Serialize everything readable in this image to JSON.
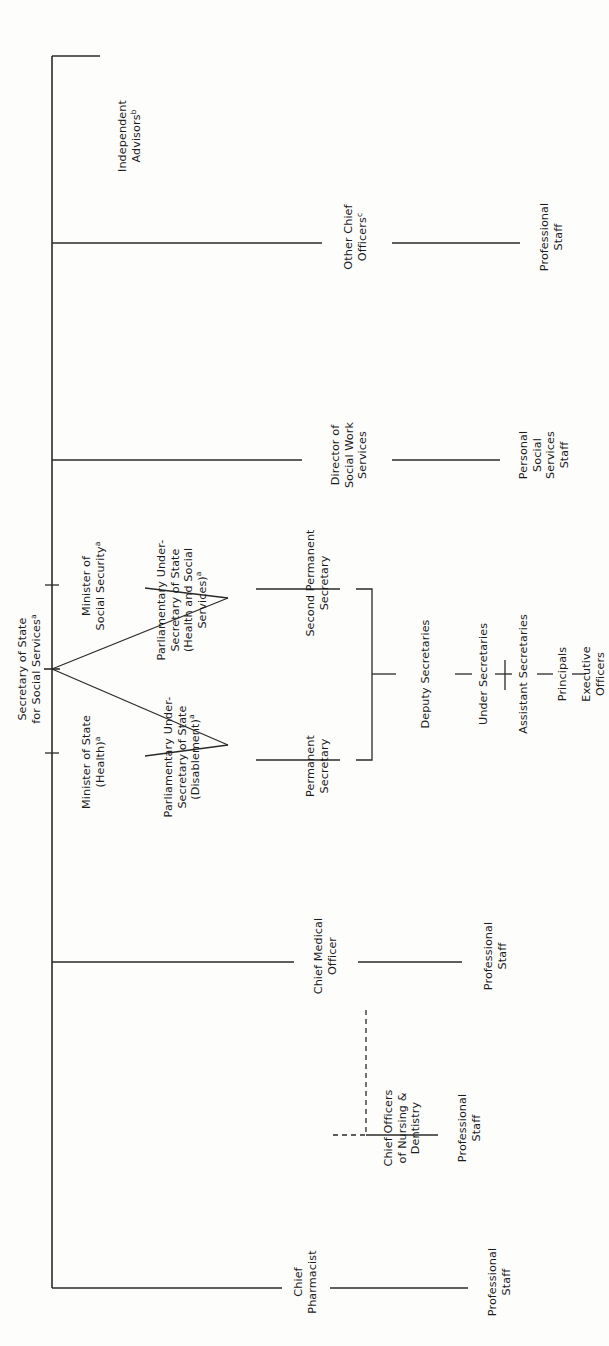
{
  "chart": {
    "orientation": "rotated-90-ccw",
    "root": {
      "id": "secretary-of-state",
      "label": "Secretary of State\nfor Social Services",
      "line1": "Secretary of State",
      "line2": "for Social Services",
      "footnote": "a"
    },
    "nodes": {
      "independent_advisors": {
        "line1": "Independent",
        "line2": "Advisors",
        "footnote": "b"
      },
      "other_chief_officers": {
        "line1": "Other Chief",
        "line2": "Officers",
        "footnote": "c"
      },
      "other_chief_officers_staff": {
        "line1": "Professional",
        "line2": "Staff",
        "footnote": ""
      },
      "director_social_work": {
        "line1": "Director of",
        "line2": "Social Work",
        "line3": "Services",
        "footnote": ""
      },
      "personal_social_services_staff": {
        "line1": "Personal",
        "line2": "Social",
        "line3": "Services",
        "line4": "Staff",
        "footnote": ""
      },
      "minister_social_security": {
        "line1": "Minister of",
        "line2": "Social Security",
        "footnote": "a"
      },
      "minister_health": {
        "line1": "Minister of State",
        "line2": "(Health)",
        "footnote": "a"
      },
      "pus_health_social": {
        "line1": "Parliamentary Under-",
        "line2": "Secretary of State",
        "line3": "(Health and Social",
        "line4": "Services)",
        "footnote": "a"
      },
      "pus_disablement": {
        "line1": "Parliamentary Under-",
        "line2": "Secretary of State",
        "line3": "(Disablement)",
        "footnote": "a"
      },
      "second_permanent_secretary": {
        "line1": "Second Permanent",
        "line2": "Secretary",
        "footnote": ""
      },
      "permanent_secretary": {
        "line1": "Permanent",
        "line2": "Secretary",
        "footnote": ""
      },
      "deputy_secretaries": {
        "line1": "Deputy Secretaries",
        "footnote": ""
      },
      "under_secretaries": {
        "line1": "Under Secretaries",
        "footnote": ""
      },
      "assistant_secretaries": {
        "line1": "Assistant Secretaries",
        "footnote": ""
      },
      "principals": {
        "line1": "Principals",
        "footnote": ""
      },
      "executive_officers": {
        "line1": "Executive",
        "line2": "Officers",
        "footnote": ""
      },
      "chief_medical_officer": {
        "line1": "Chief Medical",
        "line2": "Officer",
        "footnote": ""
      },
      "chief_medical_staff": {
        "line1": "Professional",
        "line2": "Staff",
        "footnote": ""
      },
      "chief_officers_nursing": {
        "line1": "Chief Officers",
        "line2": "of Nursing &",
        "line3": "Dentistry",
        "footnote": ""
      },
      "chief_officers_nursing_staff": {
        "line1": "Professional",
        "line2": "Staff",
        "footnote": ""
      },
      "chief_pharmacist": {
        "line1": "Chief",
        "line2": "Pharmacist",
        "footnote": ""
      },
      "chief_pharmacist_staff": {
        "line1": "Professional",
        "line2": "Staff",
        "footnote": ""
      }
    },
    "footnotes": [
      "a",
      "b",
      "c"
    ],
    "colors": {
      "line": "#2a2a2a",
      "text": "#1b1b1b",
      "background": "#fdfdfc"
    }
  }
}
